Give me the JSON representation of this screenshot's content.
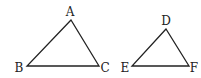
{
  "diagram": {
    "title": "",
    "stroke_color": "#222222",
    "triangles": [
      {
        "name": "ABC",
        "vertices": [
          {
            "label": "A",
            "x": 71,
            "y": 20,
            "lx": 70,
            "ly": 16
          },
          {
            "label": "B",
            "x": 27,
            "y": 66,
            "lx": 19,
            "ly": 72
          },
          {
            "label": "C",
            "x": 99,
            "y": 66,
            "lx": 105,
            "ly": 72
          }
        ]
      },
      {
        "name": "DEF",
        "vertices": [
          {
            "label": "D",
            "x": 166,
            "y": 29,
            "lx": 166,
            "ly": 25
          },
          {
            "label": "E",
            "x": 132,
            "y": 66,
            "lx": 125,
            "ly": 72
          },
          {
            "label": "F",
            "x": 189,
            "y": 66,
            "lx": 194,
            "ly": 72
          }
        ]
      }
    ]
  }
}
